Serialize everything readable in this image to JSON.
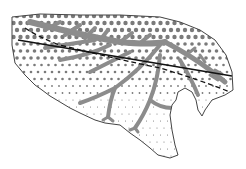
{
  "diagram": {
    "colors": {
      "background": "#ffffff",
      "outline": "#444444",
      "dots": "#7a7a7a",
      "branches": "#8c8c8c",
      "solid_line": "#111111",
      "dashed_line": "#111111"
    },
    "labels": []
  }
}
